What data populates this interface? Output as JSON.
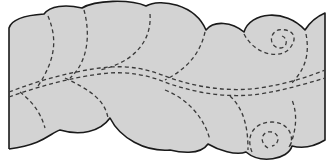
{
  "figure": {
    "description": "Quilted feather border pattern",
    "colors": {
      "fabric": "#d3d3d3",
      "outline": "#1a1a1a",
      "stitch": "#3a3a3a",
      "background": "#ffffff"
    },
    "elements": {
      "outline": "scalloped-border",
      "spine": "double-dashed-feather-spine",
      "feathers": "dashed-feather-plumes",
      "spirals": [
        "top-right-spiral",
        "bottom-right-spiral"
      ]
    }
  }
}
